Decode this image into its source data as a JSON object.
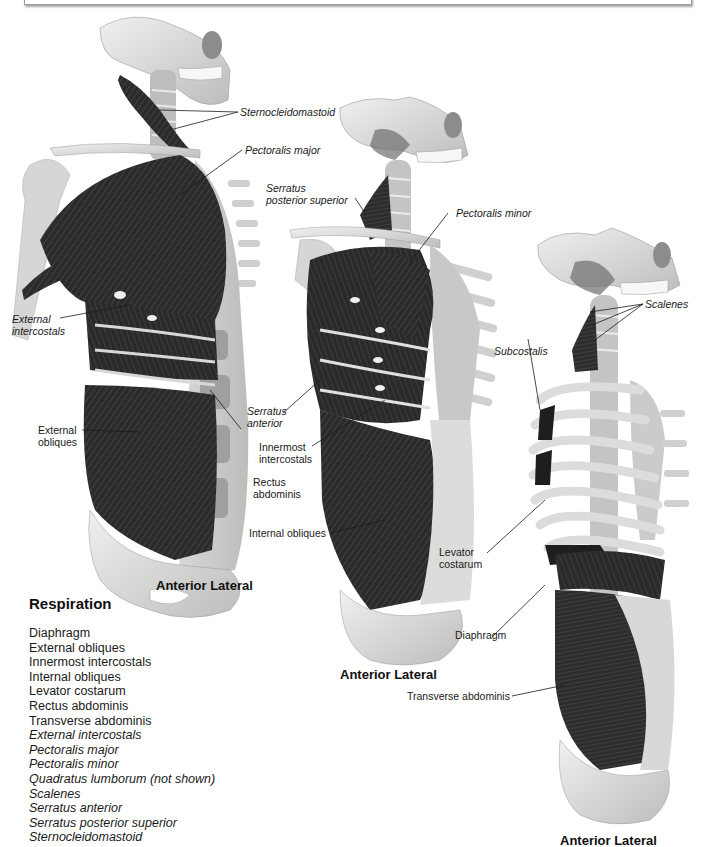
{
  "colors": {
    "background": "#ffffff",
    "bone": "#e4e4e2",
    "bone_shade": "#b9b9b7",
    "muscle": "#2b2b2b",
    "muscle_fiber": "#5a5a5a",
    "text": "#1a1a1a"
  },
  "figures": [
    {
      "view_label": "Anterior Lateral",
      "labels": [
        {
          "text": "Sternocleidomastoid",
          "italic": true
        },
        {
          "text": "Pectoralis major",
          "italic": true
        },
        {
          "text_line1": "External",
          "text_line2": "intercostals",
          "italic": true
        },
        {
          "text_line1": "External",
          "text_line2": "obliques",
          "italic": false
        },
        {
          "text_line1": "Rectus",
          "text_line2": "abdominis",
          "italic": false
        }
      ]
    },
    {
      "view_label": "Anterior Lateral",
      "labels": [
        {
          "text_line1": "Serratus",
          "text_line2": "posterior superior",
          "italic": true
        },
        {
          "text": "Pectoralis minor",
          "italic": true
        },
        {
          "text_line1": "Serratus",
          "text_line2": "anterior",
          "italic": true
        },
        {
          "text_line1": "Innermost",
          "text_line2": "intercostals",
          "italic": false
        },
        {
          "text": "Internal obliques",
          "italic": false
        }
      ]
    },
    {
      "view_label": "Anterior Lateral",
      "labels": [
        {
          "text": "Scalenes",
          "italic": true
        },
        {
          "text": "Subcostalis",
          "italic": true
        },
        {
          "text_line1": "Levator",
          "text_line2": "costarum",
          "italic": false
        },
        {
          "text": "Diaphragm",
          "italic": false
        },
        {
          "text": "Transverse abdominis",
          "italic": false
        }
      ]
    }
  ],
  "legend": {
    "title": "Respiration",
    "items": [
      {
        "text": "Diaphragm",
        "italic": false
      },
      {
        "text": "External obliques",
        "italic": false
      },
      {
        "text": "Innermost intercostals",
        "italic": false
      },
      {
        "text": "Internal obliques",
        "italic": false
      },
      {
        "text": "Levator costarum",
        "italic": false
      },
      {
        "text": "Rectus abdominis",
        "italic": false
      },
      {
        "text": "Transverse abdominis",
        "italic": false
      },
      {
        "text": "External intercostals",
        "italic": true
      },
      {
        "text": "Pectoralis major",
        "italic": true
      },
      {
        "text": "Pectoralis minor",
        "italic": true
      },
      {
        "text": "Quadratus lumborum (not shown)",
        "italic": true
      },
      {
        "text": "Scalenes",
        "italic": true
      },
      {
        "text": "Serratus anterior",
        "italic": true
      },
      {
        "text": "Serratus posterior superior",
        "italic": true
      },
      {
        "text": "Sternocleidomastoid",
        "italic": true
      }
    ]
  }
}
